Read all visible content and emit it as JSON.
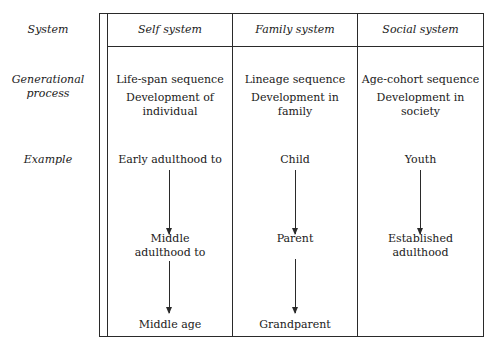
{
  "row_labels": {
    "system": "System",
    "generational_process": [
      "Generational",
      "process"
    ],
    "example": "Example"
  },
  "columns": [
    {
      "header": "Self system",
      "process": [
        "Life-span sequence"
      ],
      "development": [
        "Development of",
        "individual"
      ],
      "examples": [
        [
          "Early adulthood to"
        ],
        [
          "Middle",
          "adulthood to"
        ],
        [
          "Middle age"
        ]
      ]
    },
    {
      "header": "Family system",
      "process": [
        "Lineage sequence"
      ],
      "development": [
        "Development in",
        "family"
      ],
      "examples": [
        [
          "Child"
        ],
        [
          "Parent"
        ],
        [
          "Grandparent"
        ]
      ]
    },
    {
      "header": "Social system",
      "process": [
        "Age-cohort sequence"
      ],
      "development": [
        "Development in",
        "society"
      ],
      "examples": [
        [
          "Youth"
        ],
        [
          "Established",
          "adulthood"
        ]
      ]
    }
  ]
}
